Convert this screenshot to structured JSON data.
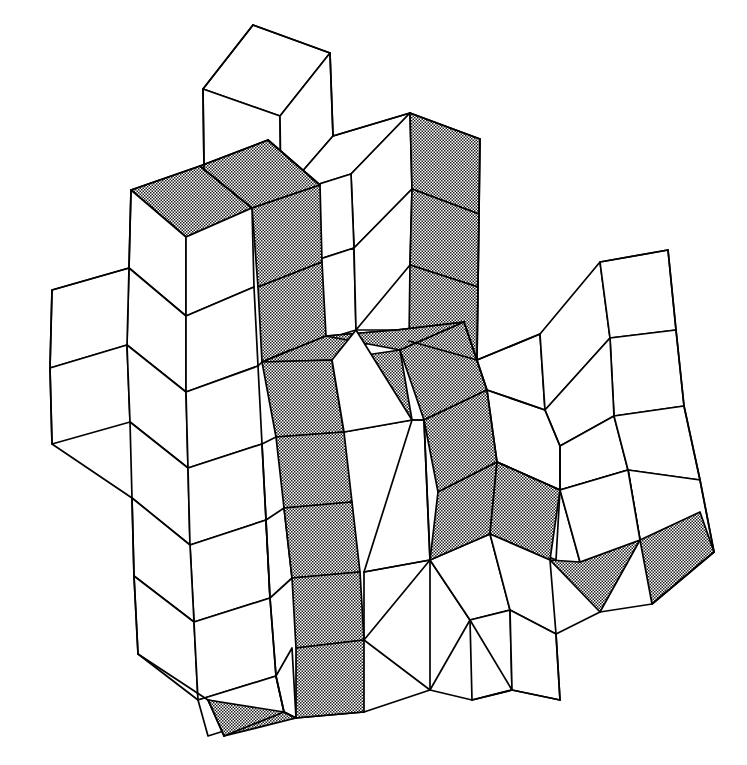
{
  "figure": {
    "title": "Rhombic tiling with highlighted worm path",
    "background_color": "#ffffff",
    "line_color": "#000000",
    "shade_color": "#808080",
    "shade_style": "stipple-50-percent",
    "stroke_width": 1.7,
    "width": 747,
    "height": 765,
    "tile_shape": "rhombus",
    "tile_count_total": 54,
    "tile_count_shaded": 19,
    "tile_count_plain": 35
  },
  "chart_data": {
    "type": "diagram",
    "title": "Rhombic tiling with highlighted worm path",
    "legend": [
      {
        "label": "unshaded rhombus",
        "fill": "#ffffff"
      },
      {
        "label": "shaded rhombus",
        "fill": "#808080"
      }
    ],
    "shaded_tiles": [
      {
        "id": "s01",
        "points": "131,190 200,166 252,208 186,237"
      },
      {
        "id": "s02",
        "points": "200,166 268,140 320,185 252,208"
      },
      {
        "id": "s03",
        "points": "252,208 320,185 322,262 258,287"
      },
      {
        "id": "s04",
        "points": "258,287 322,262 326,336 262,362"
      },
      {
        "id": "s05",
        "points": "410,113 480,139 479,214 412,189"
      },
      {
        "id": "s06",
        "points": "412,189 479,214 478,287 410,265"
      },
      {
        "id": "s07",
        "points": "410,265 478,287 477,360 409,341"
      },
      {
        "id": "s08",
        "points": "262,362 326,336 396,330 332,360"
      },
      {
        "id": "s09",
        "points": "326,336 396,330 464,322 400,350"
      },
      {
        "id": "s10",
        "points": "332,360 400,350 412,420 344,432"
      },
      {
        "id": "s11",
        "points": "400,350 464,322 487,390 424,420"
      },
      {
        "id": "s12",
        "points": "262,362 332,360 344,432 276,437"
      },
      {
        "id": "s13",
        "points": "276,437 344,432 352,502 284,508"
      },
      {
        "id": "s14",
        "points": "284,508 352,502 360,572 292,578"
      },
      {
        "id": "s15",
        "points": "292,578 360,572 364,640 296,648"
      },
      {
        "id": "s16",
        "points": "296,648 364,640 364,712 296,718"
      },
      {
        "id": "s17",
        "points": "424,420 487,390 497,462 438,492"
      },
      {
        "id": "s18",
        "points": "497,462 560,490 550,560 490,534"
      },
      {
        "id": "s19",
        "points": "560,490 628,470 640,540 580,562"
      },
      {
        "id": "s20",
        "points": "640,540 700,512 712,580 652,604"
      },
      {
        "id": "s21",
        "points": "438,492 497,462 490,534 430,560"
      },
      {
        "id": "s22",
        "points": "208,700 296,718 296,718 224,730"
      }
    ]
  },
  "tiles": [
    {
      "id": "t01",
      "shaded": false,
      "points": "203,89 253,25 330,53 280,116"
    },
    {
      "id": "t02",
      "shaded": false,
      "points": "203,89 280,116 281,196 204,168"
    },
    {
      "id": "t03",
      "shaded": false,
      "points": "280,116 330,53 333,136 281,196"
    },
    {
      "id": "t04",
      "shaded": false,
      "points": "281,196 333,136 410,113 351,174"
    },
    {
      "id": "t05",
      "shaded": false,
      "points": "351,174 410,113 412,189 354,248"
    },
    {
      "id": "t06",
      "shaded": false,
      "points": "281,196 351,174 354,248 286,270"
    },
    {
      "id": "t07",
      "shaded": false,
      "points": "286,270 354,248 356,330 290,350"
    },
    {
      "id": "t08",
      "shaded": false,
      "points": "354,248 412,189 410,265 356,330"
    },
    {
      "id": "t09",
      "shaded": false,
      "points": "131,190 186,237 186,316 129,268"
    },
    {
      "id": "t10",
      "shaded": false,
      "points": "186,237 252,208 254,287 186,316"
    },
    {
      "id": "t11",
      "shaded": false,
      "points": "129,268 186,316 186,392 127,345"
    },
    {
      "id": "t12",
      "shaded": false,
      "points": "186,316 254,287 258,366 186,392"
    },
    {
      "id": "t13",
      "shaded": false,
      "points": "52,290 129,268 127,345 50,368"
    },
    {
      "id": "t14",
      "shaded": false,
      "points": "50,368 127,345 130,422 52,444"
    },
    {
      "id": "t15",
      "shaded": false,
      "points": "127,345 186,392 188,468 130,422"
    },
    {
      "id": "t16",
      "shaded": false,
      "points": "186,392 258,366 262,444 188,468"
    },
    {
      "id": "t17",
      "shaded": false,
      "points": "130,422 188,468 190,545 132,498"
    },
    {
      "id": "t18",
      "shaded": false,
      "points": "188,468 262,444 266,520 190,545"
    },
    {
      "id": "t19",
      "shaded": false,
      "points": "190,545 266,520 270,598 194,622"
    },
    {
      "id": "t20",
      "shaded": false,
      "points": "132,498 190,545 194,622 134,576"
    },
    {
      "id": "t21",
      "shaded": false,
      "points": "134,576 194,622 198,700 138,654"
    },
    {
      "id": "t22",
      "shaded": false,
      "points": "194,622 270,598 276,676 198,700"
    },
    {
      "id": "t23",
      "shaded": false,
      "points": "198,700 276,676 284,712 208,736"
    },
    {
      "id": "t24",
      "shaded": false,
      "points": "266,520 284,508 292,578 270,598"
    },
    {
      "id": "t25",
      "shaded": false,
      "points": "276,676 292,648 296,718 284,712"
    },
    {
      "id": "t26",
      "shaded": false,
      "points": "356,330 412,420 344,432 332,360"
    },
    {
      "id": "t27",
      "shaded": false,
      "points": "412,420 424,420 430,560 364,572"
    },
    {
      "id": "t28",
      "shaded": false,
      "points": "352,502 430,560 430,560 360,572"
    },
    {
      "id": "t29",
      "shaded": false,
      "points": "364,640 430,560 470,620 430,690"
    },
    {
      "id": "t30",
      "shaded": false,
      "points": "430,560 490,534 510,610 470,620"
    },
    {
      "id": "t31",
      "shaded": false,
      "points": "470,620 510,610 512,690 472,700"
    },
    {
      "id": "t32",
      "shaded": false,
      "points": "490,534 550,560 556,634 510,610"
    },
    {
      "id": "t33",
      "shaded": false,
      "points": "510,610 556,634 560,700 512,690"
    },
    {
      "id": "t34",
      "shaded": false,
      "points": "477,360 540,334 545,410 487,390"
    },
    {
      "id": "t35",
      "shaded": false,
      "points": "540,334 600,262 610,338 545,410"
    },
    {
      "id": "t36",
      "shaded": false,
      "points": "600,262 668,250 676,330 610,338"
    },
    {
      "id": "t37",
      "shaded": false,
      "points": "610,338 676,330 684,406 614,416"
    },
    {
      "id": "t38",
      "shaded": false,
      "points": "545,410 610,338 614,416 560,446"
    },
    {
      "id": "t39",
      "shaded": false,
      "points": "560,446 614,416 628,470 560,490"
    },
    {
      "id": "t40",
      "shaded": false,
      "points": "614,416 684,406 700,480 628,470"
    },
    {
      "id": "t41",
      "shaded": false,
      "points": "628,470 700,480 714,552 640,540"
    },
    {
      "id": "t42",
      "shaded": false,
      "points": "540,334 600,262 596,340 540,334"
    },
    {
      "id": "t43",
      "shaded": false,
      "points": "497,462 560,490 556,560 497,534"
    }
  ],
  "geometry_nodes": {
    "top_cube_apex": [
      253,
      25
    ],
    "central_hub": [
      356,
      330
    ],
    "left_cluster_center": [
      186,
      316
    ],
    "right_cluster_center": [
      610,
      338
    ],
    "bottom_tip": [
      296,
      718
    ]
  }
}
